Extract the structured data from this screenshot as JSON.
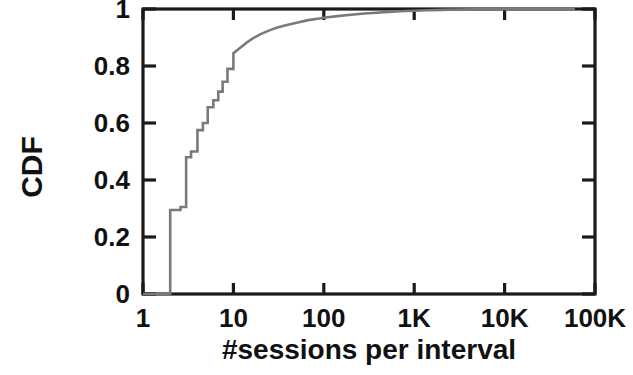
{
  "chart_data": {
    "type": "line",
    "title": "",
    "subtitle": "",
    "xlabel": "#sessions per interval",
    "ylabel": "CDF",
    "xscale": "log",
    "yscale": "linear",
    "xlim": [
      1,
      100000
    ],
    "ylim": [
      0,
      1
    ],
    "grid": false,
    "legend": null,
    "annotations": [],
    "line_color": "#7a7a7a",
    "axis_color": "#1a1a1a",
    "background_color": "#ffffff",
    "xticks": [
      {
        "value": 1,
        "label": "1"
      },
      {
        "value": 10,
        "label": "10"
      },
      {
        "value": 100,
        "label": "100"
      },
      {
        "value": 1000,
        "label": "1K"
      },
      {
        "value": 10000,
        "label": "10K"
      },
      {
        "value": 100000,
        "label": "100K"
      }
    ],
    "yticks": [
      {
        "value": 0,
        "label": "0"
      },
      {
        "value": 0.2,
        "label": "0.2"
      },
      {
        "value": 0.4,
        "label": "0.4"
      },
      {
        "value": 0.6,
        "label": "0.6"
      },
      {
        "value": 0.8,
        "label": "0.8"
      },
      {
        "value": 1,
        "label": "1"
      }
    ],
    "series": [
      {
        "name": "CDF of #sessions per interval",
        "step": true,
        "x": [
          1,
          2,
          2,
          2.6,
          2.6,
          3,
          3,
          3.4,
          3.4,
          4,
          4,
          4.6,
          4.6,
          5.2,
          5.2,
          6,
          6,
          6.8,
          6.8,
          7.6,
          7.6,
          8.6,
          8.6,
          10,
          10,
          12,
          14,
          17,
          20,
          25,
          30,
          40,
          50,
          65,
          85,
          110,
          150,
          200,
          280,
          380,
          520,
          700,
          1000,
          1400,
          2000,
          3000,
          4500,
          7000,
          10000,
          20000,
          40000,
          60000
        ],
        "y": [
          0,
          0,
          0.295,
          0.295,
          0.305,
          0.305,
          0.48,
          0.48,
          0.5,
          0.5,
          0.575,
          0.575,
          0.6,
          0.6,
          0.655,
          0.655,
          0.68,
          0.68,
          0.71,
          0.71,
          0.745,
          0.745,
          0.79,
          0.79,
          0.845,
          0.865,
          0.882,
          0.9,
          0.912,
          0.925,
          0.934,
          0.945,
          0.952,
          0.96,
          0.966,
          0.971,
          0.976,
          0.98,
          0.984,
          0.987,
          0.99,
          0.992,
          0.994,
          0.9955,
          0.997,
          0.998,
          0.9987,
          0.9993,
          0.9996,
          0.9998,
          0.9999,
          1.0
        ]
      }
    ]
  },
  "axes": {
    "y_title": "CDF",
    "x_title": "#sessions per interval"
  }
}
